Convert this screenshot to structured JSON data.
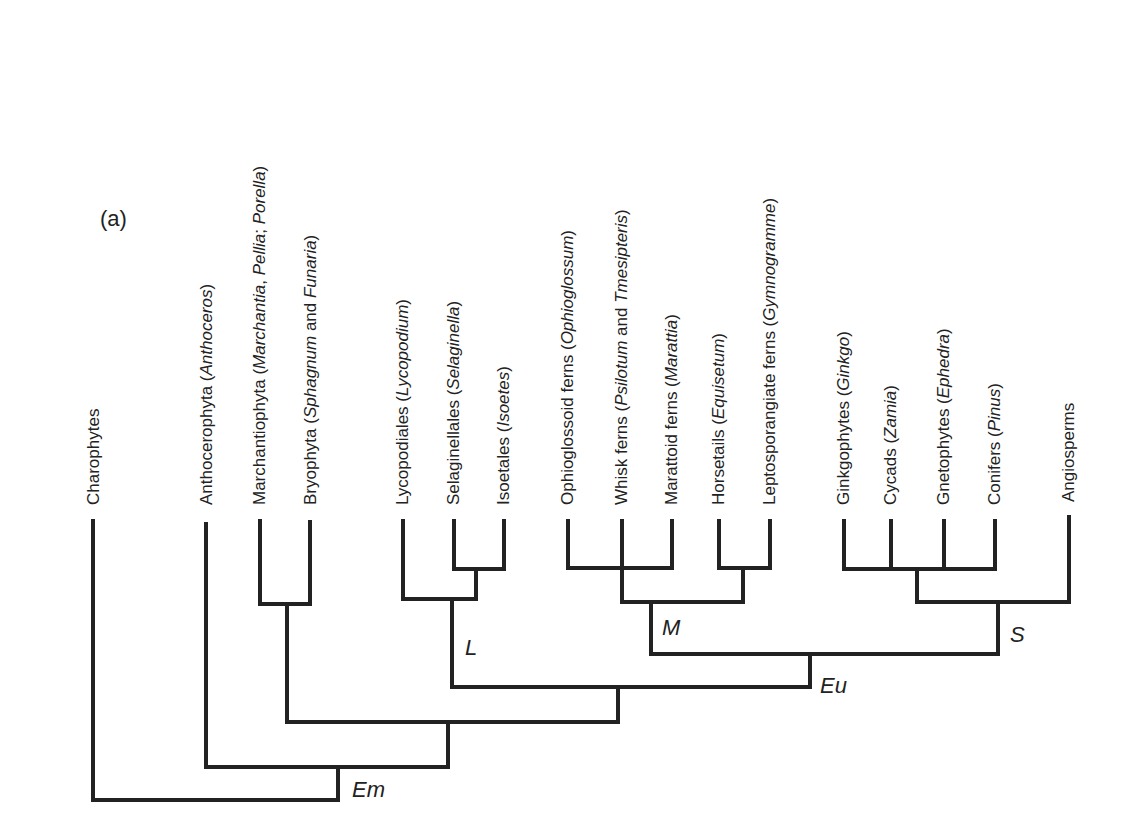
{
  "figure": {
    "panel_label": "(a)",
    "line_color": "#222222",
    "taxa": [
      {
        "name": "Charophytes",
        "genus": "",
        "x": 93
      },
      {
        "name": "Anthocerophyta",
        "genus": "Anthoceros",
        "x": 206
      },
      {
        "name": "Marchantiophyta",
        "genus_parts": [
          "Marchantia",
          "Pellia",
          "Porella"
        ],
        "x": 260
      },
      {
        "name": "Bryophyta",
        "genus_parts": [
          "Sphagnum",
          "Funaria"
        ],
        "x": 310
      },
      {
        "name": "Lycopodiales",
        "genus": "Lycopodium",
        "x": 403
      },
      {
        "name": "Selaginellales",
        "genus": "Selaginella",
        "x": 454
      },
      {
        "name": "Isoetales",
        "genus": "Isoetes",
        "x": 504
      },
      {
        "name": "Ophioglossoid ferns",
        "genus": "Ophioglossum",
        "x": 568
      },
      {
        "name": "Whisk ferns",
        "genus_parts": [
          "Psilotum",
          "Tmesipteris"
        ],
        "x": 622
      },
      {
        "name": "Marattoid ferns",
        "genus": "Marattia",
        "x": 672
      },
      {
        "name": "Horsetails",
        "genus": "Equisetum",
        "x": 719
      },
      {
        "name": "Leptosporangiate ferns",
        "genus": "Gymnogramme",
        "x": 770
      },
      {
        "name": "Ginkgophytes",
        "genus": "Ginkgo",
        "x": 844
      },
      {
        "name": "Cycads",
        "genus": "Zamia",
        "x": 891
      },
      {
        "name": "Gnetophytes",
        "genus": "Ephedra",
        "x": 944
      },
      {
        "name": "Conifers",
        "genus": "Pinus",
        "x": 995
      },
      {
        "name": "Angiosperms",
        "genus": "",
        "x": 1069
      }
    ],
    "labels": {
      "t0": "Charophytes",
      "t1a": "Anthocerophyta (",
      "t1b": "Anthoceros",
      "t1c": ")",
      "t2a": "Marchantiophyta (",
      "t2b": "Marchantia",
      "t2c": ", ",
      "t2d": "Pellia",
      "t2e": "; ",
      "t2f": "Porella",
      "t2g": ")",
      "t3a": "Bryophyta (",
      "t3b": "Sphagnum",
      "t3c": " and ",
      "t3d": "Funaria",
      "t3e": ")",
      "t4a": "Lycopodiales (",
      "t4b": "Lycopodium",
      "t4c": ")",
      "t5a": "Selaginellales (",
      "t5b": "Selaginella",
      "t5c": ")",
      "t6a": "Isoetales (",
      "t6b": "Isoetes",
      "t6c": ")",
      "t7a": "Ophioglossoid ferns (",
      "t7b": "Ophioglossum",
      "t7c": ")",
      "t8a": "Whisk ferns (",
      "t8b": "Psilotum",
      "t8c": " and ",
      "t8d": "Tmesipteris",
      "t8e": ")",
      "t9a": "Marattoid ferns (",
      "t9b": "Marattia",
      "t9c": ")",
      "t10a": "Horsetails (",
      "t10b": "Equisetum",
      "t10c": ")",
      "t11a": "Leptosporangiate ferns (",
      "t11b": "Gymnogramme",
      "t11c": ")",
      "t12a": "Ginkgophytes (",
      "t12b": "Ginkgo",
      "t12c": ")",
      "t13a": "Cycads (",
      "t13b": "Zamia",
      "t13c": ")",
      "t14a": "Gnetophytes (",
      "t14b": "Ephedra",
      "t14c": ")",
      "t15a": "Conifers (",
      "t15b": "Pinus",
      "t15c": ")",
      "t16": "Angiosperms"
    },
    "clade_labels": {
      "em": "Em",
      "eu": "Eu",
      "l": "L",
      "m": "M",
      "s": "S"
    }
  }
}
